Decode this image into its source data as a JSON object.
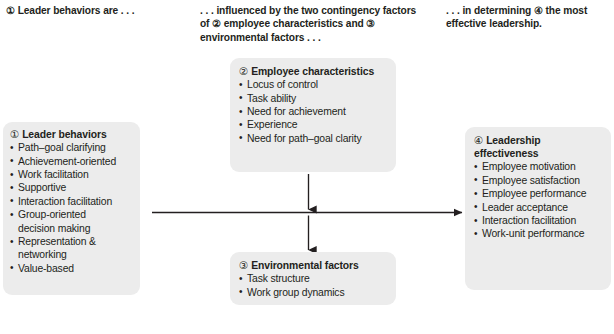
{
  "diagram": {
    "colors": {
      "box_fill": "#ececec",
      "text": "#231f20",
      "arrow": "#231f20",
      "background": "#ffffff"
    },
    "captions": [
      {
        "id": "caption-left",
        "text": "① Leader behaviors are . . ."
      },
      {
        "id": "caption-center",
        "text": ". . . influenced by the two contingency factors of ② employee characteristics and ③ environmental factors . . ."
      },
      {
        "id": "caption-right",
        "text": ". . . in determining ④ the most effective leadership."
      }
    ],
    "boxes": [
      {
        "id": "leader-behaviors",
        "number": "①",
        "title": "Leader behaviors",
        "items": [
          {
            "text": "Path–goal clarifying",
            "continuation": false
          },
          {
            "text": "Achievement-oriented",
            "continuation": false
          },
          {
            "text": "Work facilitation",
            "continuation": false
          },
          {
            "text": "Supportive",
            "continuation": false
          },
          {
            "text": "Interaction facilitation",
            "continuation": false
          },
          {
            "text": "Group-oriented",
            "continuation": false
          },
          {
            "text": "decision making",
            "continuation": true
          },
          {
            "text": "Representation &",
            "continuation": false
          },
          {
            "text": "networking",
            "continuation": true
          },
          {
            "text": "Value-based",
            "continuation": false
          }
        ]
      },
      {
        "id": "employee-characteristics",
        "number": "②",
        "title": "Employee characteristics",
        "items": [
          {
            "text": "Locus of control",
            "continuation": false
          },
          {
            "text": "Task ability",
            "continuation": false
          },
          {
            "text": "Need for achievement",
            "continuation": false
          },
          {
            "text": "Experience",
            "continuation": false
          },
          {
            "text": "Need for path–goal clarity",
            "continuation": false
          }
        ]
      },
      {
        "id": "environmental-factors",
        "number": "③",
        "title": "Environmental factors",
        "items": [
          {
            "text": "Task structure",
            "continuation": false
          },
          {
            "text": "Work group dynamics",
            "continuation": false
          }
        ]
      },
      {
        "id": "leadership-effectiveness",
        "number": "④",
        "title": "Leadership effectiveness",
        "items": [
          {
            "text": "Employee motivation",
            "continuation": false
          },
          {
            "text": "Employee satisfaction",
            "continuation": false
          },
          {
            "text": "Employee performance",
            "continuation": false
          },
          {
            "text": "Leader acceptance",
            "continuation": false
          },
          {
            "text": "Interaction facilitation",
            "continuation": false
          },
          {
            "text": "Work-unit performance",
            "continuation": false
          }
        ]
      }
    ],
    "arrows": [
      {
        "id": "arrow-behaviors-to-effectiveness",
        "from": "leader-behaviors",
        "to": "leadership-effectiveness",
        "direction": "right"
      },
      {
        "id": "arrow-employee-down",
        "from": "employee-characteristics",
        "to": "arrow-behaviors-to-effectiveness",
        "direction": "down"
      },
      {
        "id": "arrow-environment-up",
        "from": "environmental-factors",
        "to": "arrow-behaviors-to-effectiveness",
        "direction": "up"
      }
    ]
  }
}
